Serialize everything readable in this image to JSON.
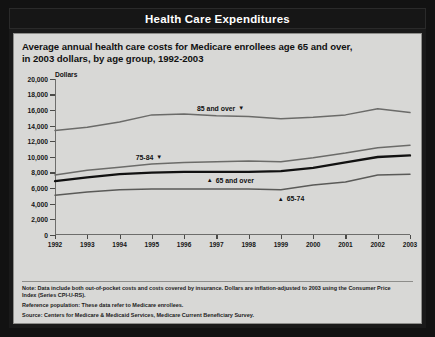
{
  "window": {
    "title": "Health Care Expenditures"
  },
  "chart_panel": {
    "subtitle_line1": "Average annual health care costs for Medicare enrollees age 65 and over,",
    "subtitle_line2": "in 2003 dollars, by age group, 1992-2003",
    "axis_unit_label": "Dollars"
  },
  "notes": {
    "note_line1": "Note:  Data include both out-of-pocket costs and costs covered by insurance. Dollars are inflation-adjusted to 2003 using the Consumer Price",
    "note_line2": "Index (Series CPI-U-RS).",
    "reference": "Reference population:  These data refer to Medicare enrollees.",
    "source": "Source:  Centers for Medicare & Medicaid Services, Medicare Current Beneficiary Survey."
  },
  "chart_data": {
    "type": "line",
    "title": "Health Care Expenditures",
    "subtitle": "Average annual health care costs for Medicare enrollees age 65 and over, in 2003 dollars, by age group, 1992-2003",
    "xlabel": "",
    "ylabel": "Dollars",
    "x": [
      1992,
      1993,
      1994,
      1995,
      1996,
      1997,
      1998,
      1999,
      2000,
      2001,
      2002,
      2003
    ],
    "xtick_labels": [
      "1992",
      "1993",
      "1994",
      "1995",
      "1996",
      "1997",
      "1998",
      "1999",
      "2000",
      "2001",
      "2002",
      "2003"
    ],
    "ylim": [
      0,
      20000
    ],
    "ytick_labels": [
      "0",
      "2,000",
      "4,000",
      "6,000",
      "8,000",
      "10,000",
      "12,000",
      "14,000",
      "16,000",
      "18,000",
      "20,000"
    ],
    "ytick_values": [
      0,
      2000,
      4000,
      6000,
      8000,
      10000,
      12000,
      14000,
      16000,
      18000,
      20000
    ],
    "grid": false,
    "legend": "inline-annotations",
    "series": [
      {
        "name": "85 and over",
        "label": "85 and over",
        "marker": "down-triangle",
        "color": "#6b6b69",
        "width": 1.5,
        "values": [
          13400,
          13800,
          14500,
          15400,
          15500,
          15300,
          15200,
          14900,
          15100,
          15400,
          16200,
          15700
        ]
      },
      {
        "name": "75-84",
        "label": "75-84",
        "marker": "down-triangle",
        "color": "#6b6b69",
        "width": 1.5,
        "values": [
          7700,
          8300,
          8700,
          9100,
          9300,
          9400,
          9500,
          9400,
          9900,
          10500,
          11200,
          11500
        ]
      },
      {
        "name": "65 and over",
        "label": "65 and over",
        "marker": "up-triangle",
        "color": "#111111",
        "width": 2.3,
        "values": [
          6900,
          7400,
          7800,
          8000,
          8100,
          8100,
          8100,
          8200,
          8600,
          9300,
          10000,
          10200
        ]
      },
      {
        "name": "65-74",
        "label": "65-74",
        "marker": "up-triangle",
        "color": "#5a5a58",
        "width": 1.5,
        "values": [
          5100,
          5500,
          5800,
          5900,
          5900,
          5900,
          5900,
          5800,
          6400,
          6800,
          7700,
          7800
        ]
      }
    ],
    "annotations": [
      {
        "text": "85 and over",
        "marker": "▼",
        "series": "85 and over",
        "at_x": 1996.4,
        "at_y": 16700
      },
      {
        "text": "75-84",
        "marker": "▼",
        "series": "75-84",
        "at_x": 1994.5,
        "at_y": 10400
      },
      {
        "text": "65 and over",
        "marker": "▲",
        "series": "65 and over",
        "at_x": 1996.7,
        "at_y": 7450
      },
      {
        "text": "65-74",
        "marker": "▲",
        "series": "65-74",
        "at_x": 1998.9,
        "at_y": 5050
      }
    ]
  }
}
